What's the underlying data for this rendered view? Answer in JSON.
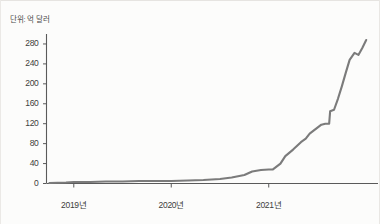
{
  "figure": {
    "unit_label": "단위: 억 달러",
    "line_color": "#7b7b7b",
    "axis_color": "#5a5a5a",
    "background": "#fcfcfb",
    "text_color": "#3c3c3c"
  },
  "chart_data": {
    "type": "line",
    "title": "",
    "subtitle": "",
    "xlabel": "",
    "ylabel": "단위: 억 달러",
    "ylim": [
      0,
      300
    ],
    "yticks": [
      0,
      40,
      80,
      120,
      160,
      200,
      240,
      280
    ],
    "ytick_labels": [
      "0",
      "40",
      "80",
      "120",
      "160",
      "200",
      "240",
      "280"
    ],
    "xtick_labels": [
      "2019년",
      "2020년",
      "2021년"
    ],
    "xtick_positions": [
      2019.0,
      2020.0,
      2021.0
    ],
    "xlim": [
      2018.72,
      2022.08
    ],
    "grid": false,
    "legend": null,
    "series": [
      {
        "name": "누적 금액",
        "x": [
          2018.75,
          2018.92,
          2019.0,
          2019.17,
          2019.33,
          2019.5,
          2019.67,
          2019.83,
          2020.0,
          2020.17,
          2020.33,
          2020.5,
          2020.62,
          2020.75,
          2020.83,
          2020.92,
          2021.0,
          2021.04,
          2021.12,
          2021.17,
          2021.25,
          2021.33,
          2021.38,
          2021.42,
          2021.5,
          2021.54,
          2021.58,
          2021.62,
          2021.63,
          2021.67,
          2021.71,
          2021.75,
          2021.79,
          2021.83,
          2021.88,
          2021.92,
          2021.96,
          2022.0
        ],
        "values": [
          1,
          2,
          3,
          3,
          4,
          4,
          5,
          5,
          5,
          6,
          7,
          9,
          12,
          17,
          24,
          27,
          28,
          28,
          40,
          55,
          68,
          83,
          90,
          100,
          112,
          118,
          120,
          120,
          145,
          148,
          170,
          195,
          222,
          248,
          262,
          258,
          272,
          288
        ]
      }
    ],
    "annotations": []
  }
}
